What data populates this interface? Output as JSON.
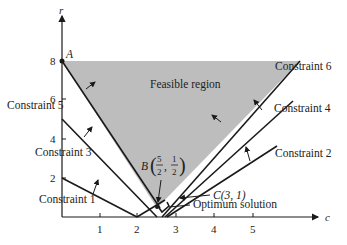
{
  "diagram": {
    "axes": {
      "x_label": "c",
      "y_label": "r",
      "x_ticks": [
        "1",
        "2",
        "3",
        "4",
        "5"
      ],
      "y_ticks": [
        "2",
        "4",
        "6",
        "8"
      ]
    },
    "region_label": "Feasible region",
    "constraints": [
      {
        "label": "Constraint 1"
      },
      {
        "label": "Constraint 2"
      },
      {
        "label": "Constraint 3"
      },
      {
        "label": "Constraint 4"
      },
      {
        "label": "Constraint 5"
      },
      {
        "label": "Constraint 6"
      }
    ],
    "points": {
      "A": {
        "label": "A"
      },
      "B": {
        "label": "B",
        "num1": "5",
        "den1": "2",
        "num2": "1",
        "den2": "2"
      },
      "C": {
        "label": "C(3, 1)"
      }
    },
    "optimum_label": "Optimum solution",
    "colors": {
      "region": "#bdbdbd",
      "line": "#1a1a1a"
    }
  }
}
